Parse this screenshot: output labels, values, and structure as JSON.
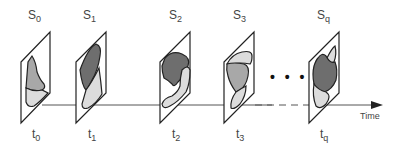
{
  "diagram": {
    "axis_label": "Time",
    "ellipsis": "• • •",
    "colors": {
      "frame": "#222222",
      "dark_region": "#6e6e6e",
      "mid_region": "#a8a8a8",
      "light_region": "#dcdcdc",
      "axis": "#555555"
    },
    "snapshots": [
      {
        "state_base": "S",
        "state_sub": "0",
        "time_base": "t",
        "time_sub": "0"
      },
      {
        "state_base": "S",
        "state_sub": "1",
        "time_base": "t",
        "time_sub": "1"
      },
      {
        "state_base": "S",
        "state_sub": "2",
        "time_base": "t",
        "time_sub": "2"
      },
      {
        "state_base": "S",
        "state_sub": "3",
        "time_base": "t",
        "time_sub": "3"
      },
      {
        "state_base": "S",
        "state_sub": "q",
        "time_base": "t",
        "time_sub": "q"
      }
    ]
  }
}
